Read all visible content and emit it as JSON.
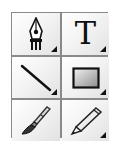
{
  "palette": {
    "name": "drawing-tools-palette",
    "border_color": "#8a8a8a",
    "tools": [
      {
        "id": "pen",
        "icon": "pen-nib-icon",
        "has_submenu": true
      },
      {
        "id": "text",
        "icon": "text-tool-icon",
        "glyph": "T",
        "has_submenu": true
      },
      {
        "id": "line",
        "icon": "line-tool-icon",
        "has_submenu": true
      },
      {
        "id": "rectangle",
        "icon": "rectangle-tool-icon",
        "has_submenu": true
      },
      {
        "id": "brush",
        "icon": "paintbrush-icon",
        "has_submenu": false
      },
      {
        "id": "pencil",
        "icon": "pencil-icon",
        "has_submenu": true
      }
    ]
  }
}
